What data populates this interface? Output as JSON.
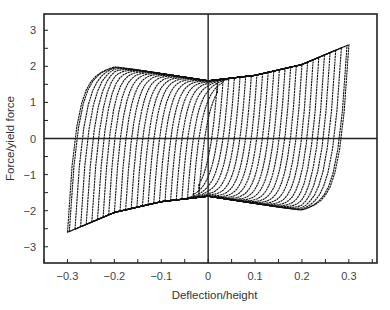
{
  "chart_data": {
    "type": "line",
    "title": "",
    "xlabel": "Deflection/height",
    "ylabel": "Force/yield force",
    "xlim": [
      -0.35,
      0.36
    ],
    "ylim": [
      -3.45,
      3.45
    ],
    "xticks": [
      -0.3,
      -0.2,
      -0.1,
      0,
      0.1,
      0.2,
      0.3
    ],
    "xtick_labels": [
      "−0.3",
      "−0.2",
      "−0.1",
      "0",
      "0.1",
      "0.2",
      "0.3"
    ],
    "yticks": [
      -3,
      -2,
      -1,
      0,
      1,
      2,
      3
    ],
    "ytick_labels": [
      "−3",
      "−2",
      "−1",
      "0",
      "1",
      "2",
      "3"
    ],
    "minor_xticks_step": 0.05,
    "minor_yticks_step": 0.5,
    "grid": false,
    "legend": null,
    "zero_lines": true,
    "series": [
      {
        "name": "hysteresis loops",
        "loop_count": 26,
        "amplitudes": [
          0.02,
          0.032,
          0.044,
          0.056,
          0.068,
          0.08,
          0.092,
          0.104,
          0.116,
          0.128,
          0.14,
          0.152,
          0.164,
          0.176,
          0.188,
          0.2,
          0.212,
          0.224,
          0.236,
          0.248,
          0.26,
          0.272,
          0.284,
          0.296,
          0.3,
          0.3
        ],
        "upper_envelope": {
          "x": [
            -0.3,
            -0.2,
            -0.1,
            0.0,
            0.1,
            0.2,
            0.3
          ],
          "y": [
            1.7,
            2.0,
            1.8,
            1.6,
            1.75,
            2.05,
            2.6
          ]
        },
        "lower_envelope": {
          "x": [
            -0.3,
            -0.2,
            -0.1,
            0.0,
            0.1,
            0.2,
            0.3
          ],
          "y": [
            -2.6,
            -2.05,
            -1.75,
            -1.6,
            -1.8,
            -2.0,
            -1.7
          ]
        },
        "peak_points": [
          {
            "x": 0.3,
            "y": 2.6
          },
          {
            "x": -0.3,
            "y": -2.6
          }
        ]
      }
    ]
  }
}
